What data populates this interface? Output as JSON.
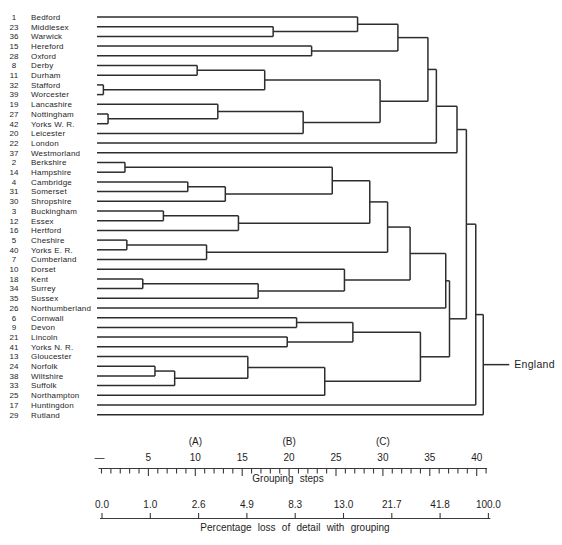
{
  "figure": {
    "background": "#ffffff",
    "line_color": "#2d2d2d",
    "text_color": "#1e1e1e"
  },
  "chart_data": {
    "type": "dendrogram",
    "orientation": "horizontal-right",
    "root_label": "England",
    "leaves": [
      {
        "num": "1",
        "name": "Bedford"
      },
      {
        "num": "23",
        "name": "Middlesex"
      },
      {
        "num": "36",
        "name": "Warwick"
      },
      {
        "num": "15",
        "name": "Hereford"
      },
      {
        "num": "28",
        "name": "Oxford"
      },
      {
        "num": "8",
        "name": "Derby"
      },
      {
        "num": "11",
        "name": "Durham"
      },
      {
        "num": "32",
        "name": "Stafford"
      },
      {
        "num": "39",
        "name": "Worcester"
      },
      {
        "num": "19",
        "name": "Lancashire"
      },
      {
        "num": "27",
        "name": "Nottingham"
      },
      {
        "num": "42",
        "name": "Yorks W. R."
      },
      {
        "num": "20",
        "name": "Leicester"
      },
      {
        "num": "22",
        "name": "London"
      },
      {
        "num": "37",
        "name": "Westmorland"
      },
      {
        "num": "2",
        "name": "Berkshire"
      },
      {
        "num": "14",
        "name": "Hampshire"
      },
      {
        "num": "4",
        "name": "Cambridge"
      },
      {
        "num": "31",
        "name": "Somerset"
      },
      {
        "num": "30",
        "name": "Shropshire"
      },
      {
        "num": "3",
        "name": "Buckingham"
      },
      {
        "num": "12",
        "name": "Essex"
      },
      {
        "num": "16",
        "name": "Hertford"
      },
      {
        "num": "5",
        "name": "Cheshire"
      },
      {
        "num": "40",
        "name": "Yorks E. R."
      },
      {
        "num": "7",
        "name": "Cumberland"
      },
      {
        "num": "10",
        "name": "Dorset"
      },
      {
        "num": "18",
        "name": "Kent"
      },
      {
        "num": "34",
        "name": "Surrey"
      },
      {
        "num": "35",
        "name": "Sussex"
      },
      {
        "num": "26",
        "name": "Northumberland"
      },
      {
        "num": "6",
        "name": "Cornwall"
      },
      {
        "num": "9",
        "name": "Devon"
      },
      {
        "num": "21",
        "name": "Lincoln"
      },
      {
        "num": "41",
        "name": "Yorks N. R."
      },
      {
        "num": "13",
        "name": "Gloucester"
      },
      {
        "num": "24",
        "name": "Norfolk"
      },
      {
        "num": "38",
        "name": "Wiltshire"
      },
      {
        "num": "33",
        "name": "Suffolk"
      },
      {
        "num": "25",
        "name": "Northampton"
      },
      {
        "num": "17",
        "name": "Huntingdon"
      },
      {
        "num": "29",
        "name": "Rutland"
      }
    ],
    "merges": [
      [
        "L7",
        "L8",
        0.2
      ],
      [
        "L10",
        "L11",
        0.7
      ],
      [
        "L15",
        "L16",
        2.5
      ],
      [
        "L23",
        "L24",
        2.7
      ],
      [
        "L27",
        "L28",
        4.4
      ],
      [
        "L36",
        "L37",
        5.7
      ],
      [
        "L20",
        "L21",
        6.6
      ],
      [
        "M5",
        "L38",
        7.8
      ],
      [
        "L17",
        "L18",
        9.2
      ],
      [
        "L5",
        "L6",
        10.2
      ],
      [
        "L9",
        "M1",
        12.4
      ],
      [
        "M8",
        "L19",
        13.2
      ],
      [
        "M6",
        "L22",
        14.6
      ],
      [
        "L35",
        "M7",
        15.6
      ],
      [
        "M4",
        "L29",
        16.7
      ],
      [
        "M9",
        "M0",
        17.4
      ],
      [
        "L1",
        "L2",
        18.3
      ],
      [
        "L33",
        "L34",
        19.8
      ],
      [
        "L31",
        "L32",
        20.8
      ],
      [
        "M10",
        "L12",
        21.5
      ],
      [
        "L3",
        "L4",
        22.4
      ],
      [
        "M13",
        "L39",
        23.8
      ],
      [
        "M2",
        "M11",
        24.6
      ],
      [
        "M3",
        "L25",
        11.2
      ],
      [
        "L26",
        "M14",
        25.9
      ],
      [
        "M18",
        "M17",
        26.8
      ],
      [
        "L0",
        "M16",
        27.3
      ],
      [
        "M22",
        "M12",
        28.6
      ],
      [
        "M15",
        "M19",
        29.7
      ],
      [
        "M27",
        "M23",
        30.5
      ],
      [
        "M26",
        "M20",
        31.6
      ],
      [
        "M29",
        "M24",
        32.9
      ],
      [
        "M25",
        "M21",
        34.0
      ],
      [
        "M30",
        "M28",
        34.8
      ],
      [
        "M33",
        "L13",
        35.7
      ],
      [
        "M31",
        "L30",
        36.7
      ],
      [
        "M35",
        "M32",
        37.1
      ],
      [
        "M34",
        "L14",
        37.9
      ],
      [
        "M37",
        "M36",
        38.9
      ],
      [
        "M38",
        "L40",
        39.9
      ],
      [
        "M39",
        "L41",
        40.7
      ]
    ],
    "axes": [
      {
        "label": "Grouping steps",
        "range": [
          0,
          41
        ],
        "minor_tick_every": 1,
        "major_ticks": [
          5,
          10,
          15,
          20,
          25,
          30,
          35,
          40
        ],
        "origin_dash": "—",
        "markers": [
          {
            "text": "(A)",
            "at": 10
          },
          {
            "text": "(B)",
            "at": 20
          },
          {
            "text": "(C)",
            "at": 30
          }
        ]
      },
      {
        "label": "Percentage loss of detail with grouping",
        "tick_labels": [
          "0.0",
          "1.0",
          "2.6",
          "4.9",
          "8.3",
          "13.0",
          "21.7",
          "41.8",
          "100.0"
        ]
      }
    ]
  }
}
